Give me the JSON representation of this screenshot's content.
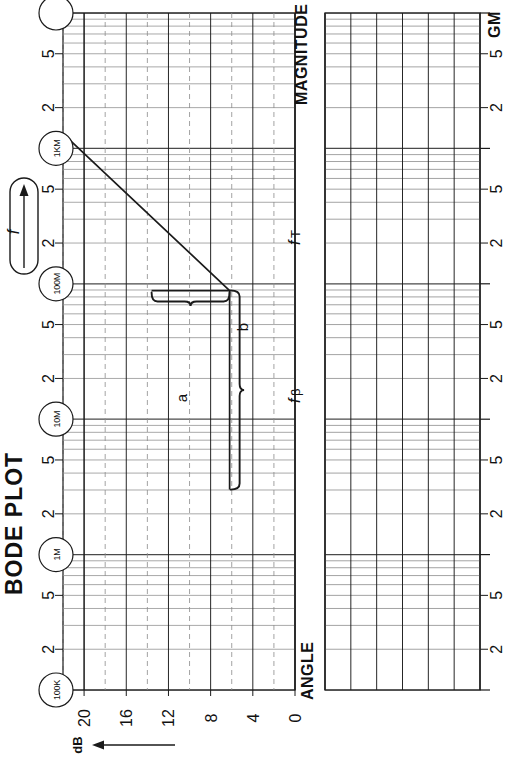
{
  "page": {
    "title": "BODE PLOT",
    "width": 526,
    "height": 763
  },
  "sections": {
    "magnitude_label": "MAGNITUDE",
    "angle_label": "ANGLE"
  },
  "frequency_axis": {
    "axis_label": "f",
    "axis_arrow": "→",
    "decade_markers": [
      "100K",
      "1M",
      "10M",
      "100M",
      "1KM",
      ""
    ],
    "minor_tick_labels": [
      "2",
      "5"
    ],
    "gain_margin_label": "GM"
  },
  "magnitude_axis": {
    "unit": "dB",
    "arrow": "←",
    "ticks": [
      "20",
      "16",
      "12",
      "8",
      "4",
      "0"
    ],
    "values": [
      20,
      16,
      12,
      8,
      4,
      0
    ]
  },
  "annotations": {
    "ft": "f",
    "ft_sub": "T",
    "fbeta": "f",
    "fbeta_sub": "β",
    "brace_a": "a",
    "brace_b": "b"
  },
  "colors": {
    "ink": "#1a1a1a",
    "grid_major": "#4a4a4a",
    "grid_minor": "#8c8c8c",
    "paper": "#ffffff"
  },
  "chart_data": {
    "type": "line",
    "title": "BODE PLOT",
    "orientation": "rotated-90-ccw",
    "xlabel": "f",
    "ylabel": "dB",
    "grid": true,
    "legend": null,
    "xscale": "log",
    "xlim": [
      100000,
      10000000000
    ],
    "xtick_decades": [
      "100K",
      "1M",
      "10M",
      "100M",
      "1KM",
      ""
    ],
    "xtick_minor": [
      2,
      5
    ],
    "ylim": [
      0,
      22
    ],
    "yticks": [
      0,
      4,
      8,
      12,
      16,
      20
    ],
    "series": [
      {
        "name": "magnitude-asymptote",
        "comment": "flat segment then +20dB/decade rising asymptote",
        "points": [
          {
            "f": 3000000,
            "dB": 6.2
          },
          {
            "f": 9000000,
            "dB": 6.2
          },
          {
            "f": 1200000000,
            "dB": 21.5
          }
        ]
      }
    ],
    "annotations": [
      {
        "label": "a",
        "kind": "horizontal-brace",
        "from_f": 3000000,
        "to_f": 90000000,
        "at_dB": 6.2
      },
      {
        "label": "b",
        "kind": "vertical-brace",
        "at_f": 90000000,
        "from_dB": 6.2,
        "to_dB": 13.5
      },
      {
        "label": "fT",
        "kind": "axis-marker"
      },
      {
        "label": "fβ",
        "kind": "axis-marker"
      },
      {
        "label": "GM",
        "kind": "axis-marker"
      }
    ]
  }
}
